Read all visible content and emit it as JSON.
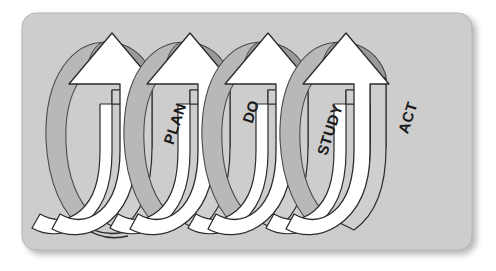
{
  "figure": {
    "name": "pdsa-cycle-diagram",
    "panel": {
      "background_color": "#cdcdcd",
      "border_color": "#b4b4b4",
      "corner_radius": 14,
      "shadow_color": "#b9b9b9"
    },
    "palette": {
      "page_background": "#ffffff",
      "arrow_face_color": "#ffffff",
      "arrow_side_color": "#cfcfcf",
      "arrow_shadow_wedge_color": "#6e6e6e",
      "loop_back_color": "#b8b8b8",
      "loop_back_dark_color": "#9a9a9a",
      "outline_color": "#2b2b2b",
      "label_color": "#1a1a1a"
    },
    "stages": [
      {
        "id": "plan",
        "label": "PLAN",
        "order": 1,
        "label_rotation_deg": -72,
        "label_x": 176,
        "label_y": 124,
        "arrow_tip_x": 148,
        "arrow_tip_y": 33,
        "loop_offset_x": 0,
        "has_trailing_tail": true
      },
      {
        "id": "do",
        "label": "DO",
        "order": 2,
        "label_rotation_deg": -72,
        "label_x": 252,
        "label_y": 112,
        "arrow_tip_x": 227,
        "arrow_tip_y": 33,
        "loop_offset_x": 78,
        "has_trailing_tail": false
      },
      {
        "id": "study",
        "label": "STUDY",
        "order": 3,
        "label_rotation_deg": -72,
        "label_x": 330,
        "label_y": 130,
        "arrow_tip_x": 306,
        "arrow_tip_y": 33,
        "loop_offset_x": 156,
        "has_trailing_tail": false
      },
      {
        "id": "act",
        "label": "ACT",
        "order": 4,
        "label_rotation_deg": -72,
        "label_x": 409,
        "label_y": 118,
        "arrow_tip_x": 385,
        "arrow_tip_y": 33,
        "loop_offset_x": 234,
        "has_trailing_tail": false
      }
    ]
  }
}
